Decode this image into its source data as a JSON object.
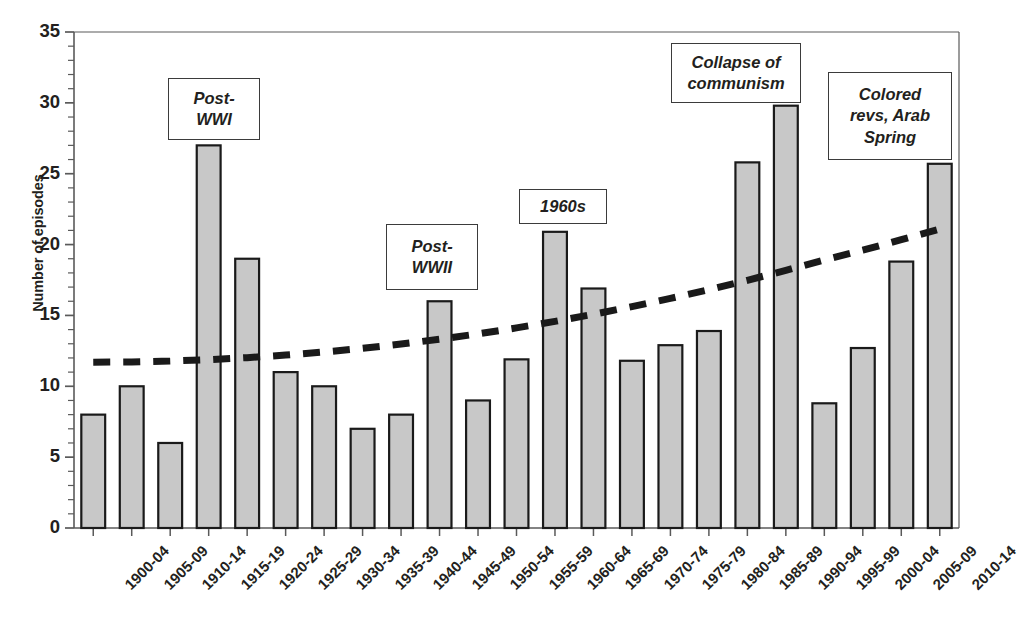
{
  "chart_data": {
    "type": "bar",
    "title": "",
    "xlabel": "",
    "ylabel": "Number of episodes",
    "ylim": [
      0,
      35
    ],
    "ytick_step": 5,
    "minor_tick_step": 1,
    "grid": false,
    "bar_color": "#c8c8c8",
    "bar_edge_color": "#1a1a1a",
    "trend_color": "#1a1a1a",
    "categories": [
      "1900-04",
      "1905-09",
      "1910-14",
      "1915-19",
      "1920-24",
      "1925-29",
      "1930-34",
      "1935-39",
      "1940-44",
      "1945-49",
      "1950-54",
      "1955-59",
      "1960-64",
      "1965-69",
      "1970-74",
      "1975-79",
      "1980-84",
      "1985-89",
      "1990-94",
      "1995-99",
      "2000-04",
      "2005-09",
      "2010-14"
    ],
    "values": [
      8,
      10,
      6,
      27,
      19,
      11,
      10,
      7,
      8,
      16,
      9,
      11.9,
      20.9,
      16.9,
      11.8,
      12.9,
      13.9,
      25.8,
      29.8,
      8.8,
      12.7,
      18.8,
      25.7
    ],
    "ytick_labels": [
      "0",
      "5",
      "10",
      "15",
      "20",
      "25",
      "30",
      "35"
    ],
    "series": [
      {
        "name": "Number of episodes",
        "type": "bar",
        "values": [
          8,
          10,
          6,
          27,
          19,
          11,
          10,
          7,
          8,
          16,
          9,
          11.9,
          20.9,
          16.9,
          11.8,
          12.9,
          13.9,
          25.8,
          29.8,
          8.8,
          12.7,
          18.8,
          25.7
        ]
      },
      {
        "name": "Trendline",
        "type": "line",
        "style": "dashed",
        "start_value": 11.7,
        "end_value": 21.1,
        "values": [
          11.7,
          11.72,
          11.78,
          11.88,
          12.02,
          12.2,
          12.42,
          12.68,
          12.98,
          13.32,
          13.7,
          14.12,
          14.58,
          15.08,
          15.62,
          16.2,
          16.82,
          17.48,
          18.18,
          18.92,
          19.6,
          20.35,
          21.1
        ]
      }
    ],
    "annotations": [
      {
        "id": "post-wwi",
        "lines": [
          "Post-",
          "WWI"
        ],
        "x": 168,
        "y": 78,
        "w": 92,
        "h": 62
      },
      {
        "id": "post-wwii",
        "lines": [
          "Post-",
          "WWII"
        ],
        "x": 386,
        "y": 224,
        "w": 92,
        "h": 66
      },
      {
        "id": "nineteen-sixties",
        "lines": [
          "1960s"
        ],
        "x": 519,
        "y": 189,
        "w": 88,
        "h": 35
      },
      {
        "id": "collapse-communism",
        "lines": [
          "Collapse of",
          "communism"
        ],
        "x": 671,
        "y": 43,
        "w": 130,
        "h": 60
      },
      {
        "id": "colored-revs",
        "lines": [
          "Colored",
          "revs, Arab",
          "Spring"
        ],
        "x": 828,
        "y": 72,
        "w": 124,
        "h": 88
      }
    ]
  }
}
